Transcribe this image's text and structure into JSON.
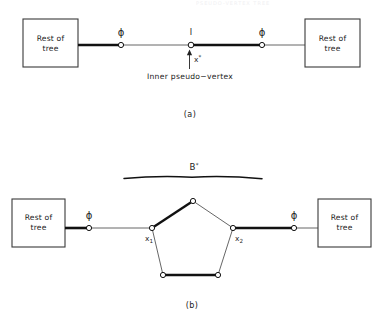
{
  "figure": {
    "faint_header": "PSEUDO-VERTEX TREE",
    "panels": [
      {
        "id": "a",
        "panel_label": "(a)",
        "left_box_label_line1": "Rest of",
        "left_box_label_line2": "tree",
        "right_box_label_line1": "Rest of",
        "right_box_label_line2": "tree",
        "left_edge_label": "ϕ",
        "right_edge_label": "ϕ",
        "center_node_label": "I",
        "arrow_label_base": "x",
        "arrow_label_sup": "*",
        "caption": "Inner pseudo−vertex"
      },
      {
        "id": "b",
        "panel_label": "(b)",
        "left_box_label_line1": "Rest of",
        "left_box_label_line2": "tree",
        "right_box_label_line1": "Rest of",
        "right_box_label_line2": "tree",
        "left_edge_label": "ϕ",
        "right_edge_label": "ϕ",
        "blossom_label_base": "B",
        "blossom_label_sup": "*",
        "vertex_left_base": "x",
        "vertex_left_sub": "1",
        "vertex_right_base": "x",
        "vertex_right_sub": "2"
      }
    ]
  },
  "colors": {
    "ink": "#1a1a1a",
    "thin_line": "#555555",
    "node_fill": "#ffffff",
    "background": "#ffffff"
  }
}
